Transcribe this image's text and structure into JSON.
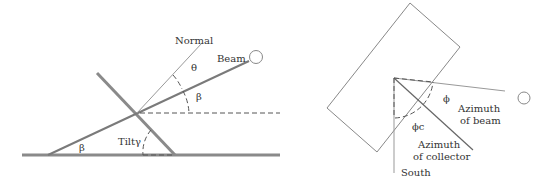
{
  "left_diagram": {
    "labels": {
      "normal": "Normal",
      "beam": "Beam",
      "theta": "θ",
      "beta_upper": "β",
      "beta_lower": "β",
      "tilt": "Tiltγ"
    }
  },
  "right_diagram": {
    "labels": {
      "phi": "ϕ",
      "azimuth_beam_1": "Azimuth",
      "azimuth_beam_2": "of beam",
      "phi_c": "ϕc",
      "azimuth_collector_1": "Azimuth",
      "azimuth_collector_2": "of collector",
      "south": "South"
    }
  }
}
